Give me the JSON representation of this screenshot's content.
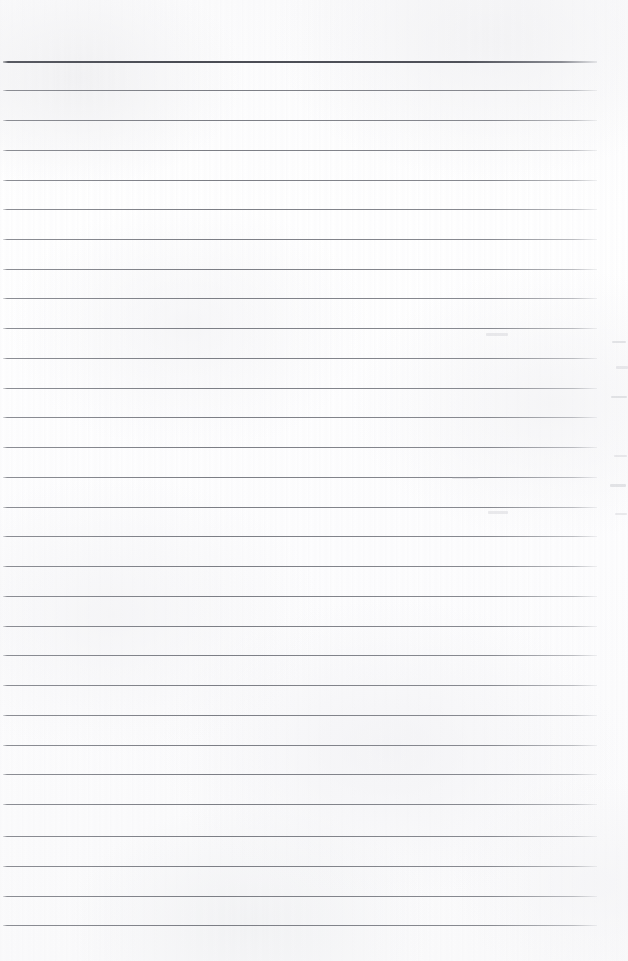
{
  "document": {
    "kind": "scanned-blank-ruled-notebook-page",
    "page_width": 628,
    "page_height": 961,
    "paper_color": "#fdfdfd",
    "orientation": "portrait",
    "text_content": "",
    "has_handwriting": false,
    "has_printed_text": false
  },
  "ruling": {
    "line_color": "#7c7e85",
    "header_line_color": "#4a4c54",
    "left_x": 3,
    "right_x": 597,
    "line_length": 594,
    "spacing": 29.8,
    "first_line_y": 61,
    "last_line_y": 925,
    "line_count": 30,
    "header_line_thickness": 2,
    "normal_line_thickness": 1,
    "lines": [
      {
        "y": 61,
        "type": "header"
      },
      {
        "y": 90,
        "type": "normal"
      },
      {
        "y": 120,
        "type": "normal"
      },
      {
        "y": 150,
        "type": "normal"
      },
      {
        "y": 180,
        "type": "normal"
      },
      {
        "y": 209,
        "type": "normal"
      },
      {
        "y": 239,
        "type": "normal"
      },
      {
        "y": 269,
        "type": "normal"
      },
      {
        "y": 298,
        "type": "normal"
      },
      {
        "y": 328,
        "type": "normal"
      },
      {
        "y": 358,
        "type": "normal"
      },
      {
        "y": 388,
        "type": "normal"
      },
      {
        "y": 417,
        "type": "normal"
      },
      {
        "y": 447,
        "type": "normal"
      },
      {
        "y": 477,
        "type": "normal"
      },
      {
        "y": 507,
        "type": "normal"
      },
      {
        "y": 536,
        "type": "normal"
      },
      {
        "y": 566,
        "type": "normal"
      },
      {
        "y": 596,
        "type": "normal"
      },
      {
        "y": 626,
        "type": "normal"
      },
      {
        "y": 655,
        "type": "normal"
      },
      {
        "y": 685,
        "type": "normal"
      },
      {
        "y": 715,
        "type": "normal"
      },
      {
        "y": 745,
        "type": "normal"
      },
      {
        "y": 774,
        "type": "normal"
      },
      {
        "y": 804,
        "type": "normal"
      },
      {
        "y": 836,
        "type": "normal"
      },
      {
        "y": 866,
        "type": "normal"
      },
      {
        "y": 896,
        "type": "normal"
      },
      {
        "y": 925,
        "type": "normal"
      }
    ]
  },
  "margins": {
    "top_blank_height": 61,
    "bottom_blank_height": 36,
    "left_blank_width": 3,
    "right_blank_width": 31
  },
  "artifacts": {
    "description": "faint ghost marks from an adjacent page at the right margin",
    "marks": [
      {
        "x": 612,
        "y": 341,
        "width": 14,
        "height": 2,
        "tone": "edge"
      },
      {
        "x": 616,
        "y": 366,
        "width": 12,
        "height": 3,
        "tone": "soft"
      },
      {
        "x": 611,
        "y": 396,
        "width": 16,
        "height": 2,
        "tone": "edge"
      },
      {
        "x": 614,
        "y": 455,
        "width": 13,
        "height": 2,
        "tone": "soft"
      },
      {
        "x": 610,
        "y": 484,
        "width": 16,
        "height": 3,
        "tone": "edge"
      },
      {
        "x": 615,
        "y": 513,
        "width": 12,
        "height": 2,
        "tone": "soft"
      },
      {
        "x": 486,
        "y": 333,
        "width": 22,
        "height": 3,
        "tone": "soft"
      },
      {
        "x": 488,
        "y": 511,
        "width": 20,
        "height": 3,
        "tone": "soft"
      },
      {
        "x": 452,
        "y": 477,
        "width": 26,
        "height": 2,
        "tone": "soft"
      }
    ]
  }
}
